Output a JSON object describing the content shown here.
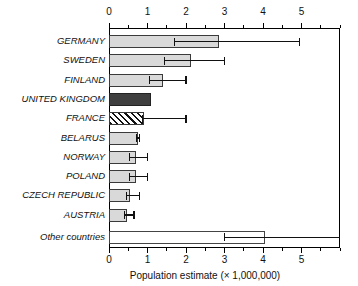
{
  "chart_data": {
    "type": "bar",
    "orientation": "horizontal",
    "title": "",
    "xlabel": "Population estimate (× 1,000,000)",
    "ylabel": "",
    "xlim": [
      0,
      6
    ],
    "xticks": [
      0,
      1,
      2,
      3,
      4,
      5
    ],
    "xtick_labels": [
      "0",
      "1",
      "2",
      "3",
      "4",
      "5"
    ],
    "minor_tick_step": 0.5,
    "grid": false,
    "legend": "none",
    "top_axis": true,
    "bottom_axis": true,
    "categories": [
      "GERMANY",
      "SWEDEN",
      "FINLAND",
      "UNITED KINGDOM",
      "FRANCE",
      "BELARUS",
      "NORWAY",
      "POLAND",
      "CZECH REPUBLIC",
      "AUSTRIA",
      "Other countries"
    ],
    "values": [
      2.85,
      2.12,
      1.4,
      1.1,
      0.9,
      0.75,
      0.7,
      0.7,
      0.55,
      0.48,
      4.05
    ],
    "error_low": [
      1.7,
      1.45,
      1.05,
      null,
      0.88,
      0.72,
      0.53,
      0.53,
      0.45,
      0.4,
      3.0
    ],
    "error_high": [
      4.95,
      3.0,
      2.0,
      null,
      2.0,
      0.8,
      1.0,
      1.0,
      0.8,
      0.65,
      6.0
    ],
    "bar_styles": [
      "light",
      "light",
      "light",
      "dark",
      "hatch",
      "light",
      "light",
      "light",
      "light",
      "light",
      "open"
    ]
  }
}
